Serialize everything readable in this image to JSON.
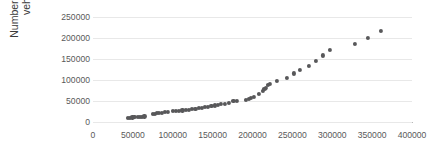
{
  "chart_data": {
    "type": "scatter",
    "title": "",
    "xlabel": "",
    "ylabel": "Number of private vehicles",
    "xlim": [
      0,
      400000
    ],
    "ylim": [
      0,
      250000
    ],
    "x_ticks": [
      0,
      50000,
      100000,
      150000,
      200000,
      250000,
      300000,
      350000,
      400000
    ],
    "y_ticks": [
      0,
      50000,
      100000,
      150000,
      200000,
      250000
    ],
    "x_tick_labels": [
      "0",
      "50000",
      "100000",
      "150000",
      "200000",
      "250000",
      "300000",
      "350000",
      "400000"
    ],
    "y_tick_labels": [
      "0",
      "50000",
      "100000",
      "150000",
      "200000",
      "250000"
    ],
    "grid": "horizontal",
    "legend": "none",
    "marker_color": "#58585a",
    "series": [
      {
        "name": "private vehicles",
        "points": [
          [
            44000,
            9000
          ],
          [
            46500,
            10000
          ],
          [
            49500,
            11000
          ],
          [
            52000,
            11500
          ],
          [
            56000,
            12000
          ],
          [
            58500,
            12500
          ],
          [
            61500,
            13000
          ],
          [
            64500,
            13500
          ],
          [
            75000,
            19000
          ],
          [
            77500,
            20000
          ],
          [
            80000,
            21000
          ],
          [
            82500,
            22000
          ],
          [
            86500,
            22500
          ],
          [
            90000,
            23500
          ],
          [
            94000,
            24500
          ],
          [
            100000,
            25500
          ],
          [
            104000,
            26500
          ],
          [
            108000,
            27000
          ],
          [
            112000,
            27500
          ],
          [
            116500,
            28500
          ],
          [
            120000,
            29000
          ],
          [
            124500,
            30500
          ],
          [
            128500,
            32000
          ],
          [
            132500,
            33500
          ],
          [
            136500,
            34500
          ],
          [
            140500,
            35500
          ],
          [
            144500,
            36500
          ],
          [
            148500,
            38000
          ],
          [
            153000,
            39500
          ],
          [
            157000,
            41000
          ],
          [
            160500,
            42500
          ],
          [
            165000,
            43500
          ],
          [
            170500,
            46000
          ],
          [
            176000,
            50500
          ],
          [
            180000,
            51000
          ],
          [
            192000,
            53500
          ],
          [
            195000,
            55000
          ],
          [
            198500,
            57500
          ],
          [
            201500,
            60500
          ],
          [
            208000,
            66500
          ],
          [
            213500,
            74500
          ],
          [
            215000,
            78500
          ],
          [
            216500,
            81000
          ],
          [
            219500,
            89000
          ],
          [
            221500,
            91000
          ],
          [
            231000,
            97500
          ],
          [
            243500,
            105000
          ],
          [
            252000,
            115500
          ],
          [
            259500,
            124500
          ],
          [
            270500,
            133500
          ],
          [
            280000,
            144500
          ],
          [
            288000,
            158500
          ],
          [
            297500,
            172000
          ],
          [
            328000,
            186000
          ],
          [
            345000,
            200000
          ],
          [
            361000,
            216500
          ]
        ]
      }
    ]
  },
  "axes": {
    "y_title": "Number of private vehicles"
  }
}
